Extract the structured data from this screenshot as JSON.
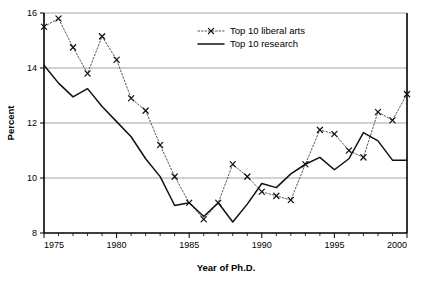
{
  "chart_data": {
    "type": "line",
    "title": "",
    "xlabel": "Year of Ph.D.",
    "ylabel": "Percent",
    "x": [
      1975,
      1976,
      1977,
      1978,
      1979,
      1980,
      1981,
      1982,
      1983,
      1984,
      1985,
      1986,
      1987,
      1988,
      1989,
      1990,
      1991,
      1992,
      1993,
      1994,
      1995,
      1996,
      1997,
      1998,
      1999,
      2000
    ],
    "xlim": [
      1975,
      2000
    ],
    "ylim": [
      8,
      16
    ],
    "xticks": [
      1975,
      1980,
      1985,
      1990,
      1995,
      2000
    ],
    "xtick_labels": [
      "1975",
      "1980",
      "1985",
      "1990",
      "1995",
      "2000"
    ],
    "yticks": [
      8,
      10,
      12,
      14,
      16
    ],
    "ytick_labels": [
      "8",
      "10",
      "12",
      "14",
      "16"
    ],
    "xtick_minor_step": 1,
    "grid": "horizontal",
    "gridlines_at": [
      10,
      12,
      14,
      16
    ],
    "legend_position": "top-center",
    "series": [
      {
        "name": "Top 10 liberal arts",
        "style": "dotted",
        "marker": "x",
        "color": "#555555",
        "x": [
          1975,
          1976,
          1977,
          1978,
          1979,
          1980,
          1981,
          1982,
          1983,
          1984,
          1985,
          1986,
          1987,
          1988,
          1989,
          1990,
          1991,
          1992,
          1993,
          1994,
          1995,
          1996,
          1997,
          1998,
          1999,
          2000
        ],
        "values": [
          15.5,
          15.8,
          14.75,
          13.8,
          15.15,
          14.3,
          12.9,
          12.45,
          11.2,
          10.05,
          9.1,
          8.5,
          9.1,
          10.5,
          10.05,
          9.5,
          9.35,
          9.2,
          10.5,
          11.75,
          11.6,
          11.0,
          10.75,
          12.4,
          12.1,
          13.05
        ]
      },
      {
        "name": "Top 10 research",
        "style": "solid",
        "marker": "none",
        "color": "#111111",
        "x": [
          1975,
          1976,
          1977,
          1978,
          1979,
          1980,
          1981,
          1982,
          1983,
          1984,
          1985,
          1986,
          1987,
          1988,
          1989,
          1990,
          1991,
          1992,
          1993,
          1994,
          1995,
          1996,
          1997,
          1998,
          1999,
          2000
        ],
        "values": [
          14.1,
          13.45,
          12.95,
          13.25,
          12.6,
          12.05,
          11.5,
          10.7,
          10.05,
          9.0,
          9.1,
          8.6,
          9.1,
          8.4,
          9.05,
          9.8,
          9.65,
          10.15,
          10.5,
          10.75,
          10.3,
          10.7,
          11.65,
          11.35,
          10.65,
          10.65
        ]
      }
    ]
  },
  "legend": {
    "entries": [
      {
        "label": "Top 10 liberal arts"
      },
      {
        "label": "Top 10 research"
      }
    ]
  }
}
